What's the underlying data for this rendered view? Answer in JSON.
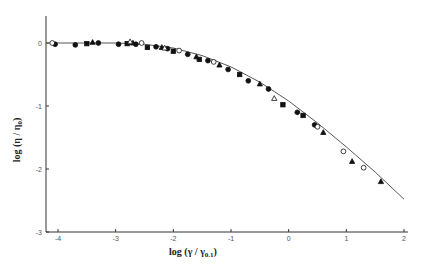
{
  "chart_data": {
    "type": "scatter",
    "title": "",
    "xlabel": "log (γ / γ0.1)",
    "ylabel": "log (η / η0)",
    "xlim": [
      -4.2,
      2
    ],
    "ylim": [
      -3,
      0.5
    ],
    "xticks": [
      -4,
      -3,
      -2,
      -1,
      0,
      1,
      2
    ],
    "yticks": [
      0,
      -1,
      -2,
      -3
    ],
    "grid": false,
    "legend": null,
    "fit_curve": {
      "name": "master curve",
      "x": [
        -4.2,
        -3.5,
        -3.0,
        -2.5,
        -2.0,
        -1.5,
        -1.0,
        -0.5,
        0.0,
        0.5,
        1.0,
        1.5,
        2.0
      ],
      "y": [
        0.0,
        0.0,
        0.0,
        -0.02,
        -0.08,
        -0.2,
        -0.38,
        -0.62,
        -0.92,
        -1.27,
        -1.65,
        -2.05,
        -2.48
      ]
    },
    "series": [
      {
        "name": "filled circles",
        "marker": "circle-filled",
        "x": [
          -4.05,
          -3.7,
          -3.3,
          -2.95,
          -2.65,
          -2.3,
          -2.1,
          -1.75,
          -1.4,
          -1.05,
          -0.7,
          -0.35,
          0.15,
          0.45
        ],
        "y": [
          -0.02,
          -0.03,
          0.0,
          -0.02,
          -0.02,
          -0.06,
          -0.09,
          -0.18,
          -0.28,
          -0.42,
          -0.6,
          -0.73,
          -1.1,
          -1.3
        ]
      },
      {
        "name": "filled squares",
        "marker": "square-filled",
        "x": [
          -3.5,
          -2.8,
          -2.45,
          -2.0,
          -1.55,
          -0.85,
          -0.1,
          0.25
        ],
        "y": [
          -0.01,
          -0.01,
          -0.07,
          -0.13,
          -0.26,
          -0.5,
          -0.98,
          -1.15
        ]
      },
      {
        "name": "filled triangles",
        "marker": "triangle-filled",
        "x": [
          -3.4,
          -2.7,
          -2.2,
          -1.6,
          -1.2,
          -0.5,
          0.6,
          1.1,
          1.6
        ],
        "y": [
          0.01,
          0.0,
          -0.07,
          -0.22,
          -0.35,
          -0.65,
          -1.42,
          -1.88,
          -2.2
        ]
      },
      {
        "name": "open circles",
        "marker": "circle-open",
        "x": [
          -4.1,
          -2.55,
          -1.9,
          -1.3,
          0.5,
          0.95,
          1.3
        ],
        "y": [
          0.0,
          0.0,
          -0.12,
          -0.3,
          -1.33,
          -1.72,
          -1.98
        ]
      },
      {
        "name": "open triangles",
        "marker": "triangle-open",
        "x": [
          -2.75,
          -2.15,
          -0.25
        ],
        "y": [
          0.02,
          -0.08,
          -0.88
        ]
      }
    ]
  },
  "axes": {
    "x_title_main": "log (γ / γ",
    "x_title_sub": "0.1",
    "x_title_end": ")",
    "y_title_main": "log (η / η",
    "y_title_sub": "0",
    "y_title_end": ")",
    "x_tick_labels": [
      "-4",
      "-3",
      "-2",
      "-1",
      "0",
      "1",
      "2"
    ],
    "y_tick_labels": [
      "0",
      "-1",
      "-2",
      "-3"
    ]
  },
  "colors": {
    "axis": "#333333",
    "curve": "#444444",
    "marker": "#111111",
    "text": "#222222"
  }
}
